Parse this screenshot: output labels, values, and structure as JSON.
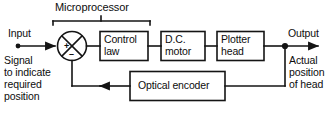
{
  "diagram": {
    "bracket_label": "Microprocessor",
    "blocks": [
      {
        "id": "control-law",
        "line1": "Control",
        "line2": "law"
      },
      {
        "id": "dc-motor",
        "line1": "D.C.",
        "line2": "motor"
      },
      {
        "id": "plotter-head",
        "line1": "Plotter",
        "line2": "head"
      },
      {
        "id": "optical-encoder",
        "line1": "Optical encoder",
        "line2": ""
      }
    ],
    "summing_junction": {
      "name": "summing-junction",
      "positive_sign": "+",
      "negative_sign": "–"
    },
    "labels": {
      "input": "Input",
      "input_description": [
        "Signal",
        "to indicate",
        "required",
        "position"
      ],
      "output": "Output",
      "output_description": [
        "Actual",
        "position",
        "of head"
      ]
    },
    "colors": {
      "line": "#141414",
      "text": "#0d0d0d",
      "background": "#ffffff"
    }
  }
}
